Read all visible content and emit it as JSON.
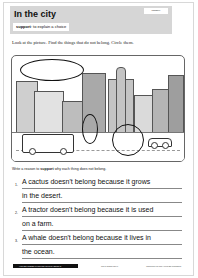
{
  "header": {
    "title": "In the city",
    "tag": "Imagery",
    "support_label": "support",
    "support_text": ": to explain a choice"
  },
  "instructions": "Look at the picture. Find the things that do not belong. Circle them.",
  "picture": {
    "description": "City scene with buildings, a bus, a car, and circled out-of-place items",
    "circled_items": [
      "whale",
      "cactus",
      "tractor"
    ]
  },
  "prompt": {
    "pre": "Write a reason to ",
    "bold": "support",
    "post": " why each thing does not belong."
  },
  "answers": [
    {
      "number": "1.",
      "line1": "A cactus doesn't belong because it grows",
      "line2": "in the desert."
    },
    {
      "number": "2.",
      "line1": "A tractor doesn't belong because it is used",
      "line2": "on a farm."
    },
    {
      "number": "3.",
      "line1": "A whale doesn't belong because it lives in",
      "line2": "the ocean."
    }
  ],
  "footer": {
    "left": "HIGHER ORDER THINKING SKILLS • BOOK 2",
    "middle": "978-1-86365-787-6",
    "right": "www.prim-ed.com • Prim-Ed Publishing"
  }
}
